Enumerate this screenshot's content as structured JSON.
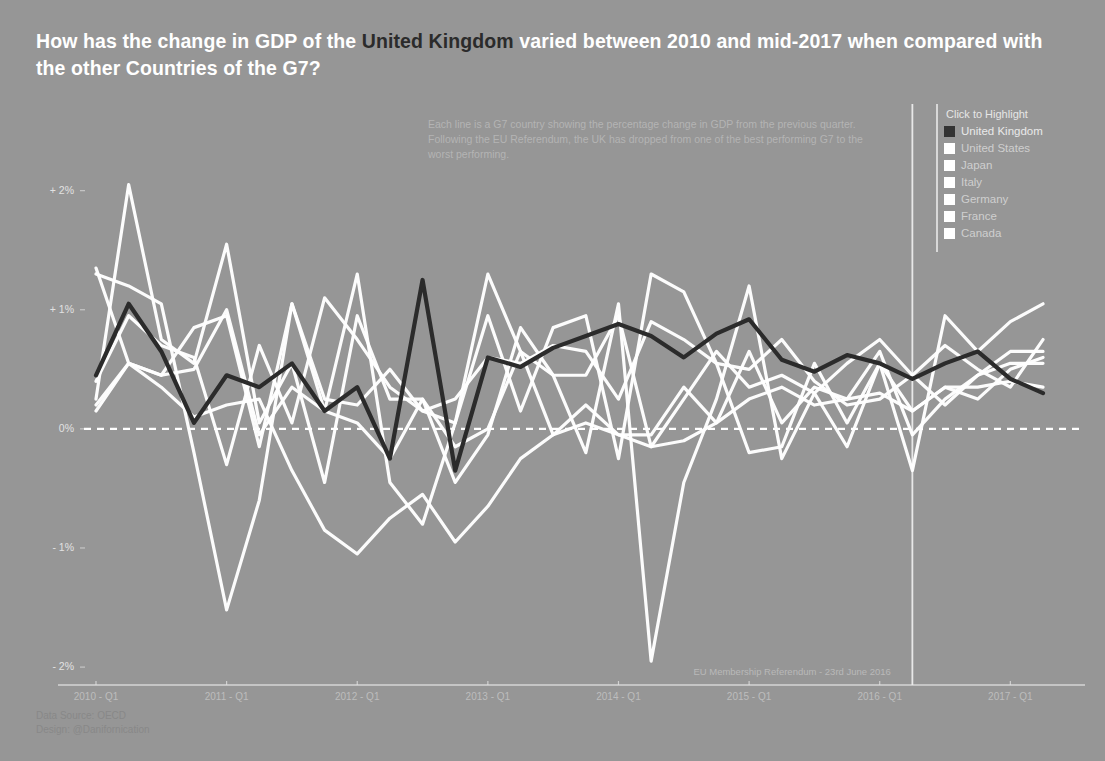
{
  "title": {
    "part1": "How has the change in GDP of the ",
    "highlight": "United Kingdom",
    "part2": " varied between 2010 and mid-2017 when compared with the other Countries of the G7?"
  },
  "annotation": {
    "line1": "Each line is a G7 country showing the percentage change in GDP from the previous quarter.",
    "line2": "Following the EU Referendum, the UK has dropped from one of the best performing G7 to the",
    "line3": "worst performing."
  },
  "legend": {
    "title": "Click to Highlight",
    "items": [
      {
        "label": "United Kingdom",
        "color": "#333333",
        "highlighted": true
      },
      {
        "label": "United States",
        "color": "#ffffff",
        "highlighted": false
      },
      {
        "label": "Japan",
        "color": "#ffffff",
        "highlighted": false
      },
      {
        "label": "Italy",
        "color": "#ffffff",
        "highlighted": false
      },
      {
        "label": "Germany",
        "color": "#ffffff",
        "highlighted": false
      },
      {
        "label": "France",
        "color": "#ffffff",
        "highlighted": false
      },
      {
        "label": "Canada",
        "color": "#ffffff",
        "highlighted": false
      }
    ]
  },
  "referendum": {
    "note": "EU Membership Referendum - 23rd June 2016"
  },
  "footer": {
    "source": "Data Source: OECD",
    "design": "Design: @Danifornication"
  },
  "colors": {
    "background": "#969696",
    "highlight_line": "#2b2b2b",
    "other_line": "#ffffff",
    "zero_line": "#ffffff",
    "axis": "#d8d8d8",
    "title_text": "#ffffff",
    "muted_text": "#bdbdbd"
  },
  "chart_data": {
    "type": "line",
    "title": "How has the change in GDP of the United Kingdom varied between 2010 and mid-2017 when compared with the other Countries of the G7?",
    "subtitle": "Each line is a G7 country showing the percentage change in GDP from the previous quarter. Following the EU Referendum, the UK has dropped from one of the best performing G7 to the worst performing.",
    "xlabel": "",
    "ylabel": "% change in GDP from previous quarter",
    "ylim": [
      -2.1,
      2.4
    ],
    "xlim": [
      "2010-Q1",
      "2017-Q2"
    ],
    "grid": false,
    "legend_position": "top-right",
    "ytick_labels": [
      "+ 2%",
      "+ 1%",
      "0%",
      "- 1%",
      "- 2%"
    ],
    "ytick_values": [
      2,
      1,
      0,
      -1,
      -2
    ],
    "xtick_labels": [
      "2010 - Q1",
      "2011 - Q1",
      "2012 - Q1",
      "2013 - Q1",
      "2014 - Q1",
      "2015 - Q1",
      "2016 - Q1",
      "2017 - Q1"
    ],
    "xtick_values": [
      0,
      4,
      8,
      12,
      16,
      20,
      24,
      28
    ],
    "x": [
      "2010-Q1",
      "2010-Q2",
      "2010-Q3",
      "2010-Q4",
      "2011-Q1",
      "2011-Q2",
      "2011-Q3",
      "2011-Q4",
      "2012-Q1",
      "2012-Q2",
      "2012-Q3",
      "2012-Q4",
      "2013-Q1",
      "2013-Q2",
      "2013-Q3",
      "2013-Q4",
      "2014-Q1",
      "2014-Q2",
      "2014-Q3",
      "2014-Q4",
      "2015-Q1",
      "2015-Q2",
      "2015-Q3",
      "2015-Q4",
      "2016-Q1",
      "2016-Q2",
      "2016-Q3",
      "2016-Q4",
      "2017-Q1",
      "2017-Q2"
    ],
    "annotations": [
      {
        "text": "EU Membership Referendum - 23rd June 2016",
        "x": "2016-Q2",
        "type": "vline"
      }
    ],
    "series": [
      {
        "name": "United Kingdom",
        "color": "#2b2b2b",
        "highlighted": true,
        "values": [
          0.45,
          1.05,
          0.65,
          0.05,
          0.45,
          0.35,
          0.55,
          0.15,
          0.35,
          -0.25,
          1.25,
          -0.35,
          0.6,
          0.52,
          0.68,
          0.78,
          0.88,
          0.78,
          0.6,
          0.8,
          0.92,
          0.58,
          0.48,
          0.62,
          0.55,
          0.42,
          0.55,
          0.65,
          0.42,
          0.3
        ]
      },
      {
        "name": "United States",
        "color": "#ffffff",
        "highlighted": false,
        "values": [
          0.4,
          0.95,
          0.7,
          0.6,
          -0.3,
          0.7,
          0.05,
          1.1,
          0.75,
          0.35,
          0.15,
          0.05,
          0.95,
          0.15,
          0.85,
          0.95,
          -0.25,
          1.3,
          1.15,
          0.55,
          0.5,
          0.75,
          0.4,
          0.2,
          0.25,
          0.45,
          0.7,
          0.5,
          0.35,
          0.75
        ]
      },
      {
        "name": "Japan",
        "color": "#ffffff",
        "highlighted": false,
        "values": [
          1.3,
          1.2,
          1.05,
          -0.2,
          -1.52,
          -0.6,
          1.05,
          0.15,
          1.3,
          -0.45,
          -0.8,
          0.05,
          1.3,
          0.65,
          0.45,
          -0.2,
          1.05,
          -1.95,
          -0.45,
          0.25,
          1.2,
          -0.25,
          0.3,
          -0.15,
          0.55,
          0.15,
          0.35,
          0.25,
          0.5,
          0.6
        ]
      },
      {
        "name": "Italy",
        "color": "#ffffff",
        "highlighted": false,
        "values": [
          0.15,
          0.55,
          0.35,
          0.1,
          0.2,
          0.25,
          -0.35,
          -0.85,
          -1.05,
          -0.75,
          -0.55,
          -0.95,
          -0.65,
          -0.25,
          -0.05,
          0.05,
          -0.05,
          -0.15,
          -0.1,
          0.05,
          0.25,
          0.35,
          0.2,
          0.25,
          0.3,
          0.15,
          0.35,
          0.35,
          0.4,
          0.35
        ]
      },
      {
        "name": "Germany",
        "color": "#ffffff",
        "highlighted": false,
        "values": [
          0.25,
          2.05,
          0.75,
          0.55,
          1.55,
          0.05,
          0.55,
          -0.45,
          0.95,
          0.25,
          0.25,
          -0.45,
          -0.05,
          0.85,
          0.45,
          0.45,
          0.95,
          -0.15,
          0.25,
          0.65,
          0.35,
          0.45,
          0.3,
          0.55,
          0.75,
          0.45,
          0.2,
          0.45,
          0.65,
          0.65
        ]
      },
      {
        "name": "France",
        "color": "#ffffff",
        "highlighted": false,
        "values": [
          0.2,
          0.55,
          0.45,
          0.5,
          1.0,
          -0.05,
          0.35,
          0.15,
          0.05,
          -0.25,
          0.25,
          -0.15,
          0.0,
          0.65,
          -0.05,
          0.2,
          -0.05,
          -0.05,
          0.35,
          0.05,
          0.65,
          0.05,
          0.35,
          0.25,
          0.65,
          -0.05,
          0.25,
          0.45,
          0.55,
          0.55
        ]
      },
      {
        "name": "Canada",
        "color": "#ffffff",
        "highlighted": false,
        "values": [
          1.35,
          0.55,
          0.45,
          0.85,
          0.95,
          -0.15,
          1.05,
          0.25,
          0.2,
          0.5,
          0.15,
          0.25,
          0.6,
          0.55,
          0.7,
          0.65,
          0.25,
          0.9,
          0.75,
          0.55,
          -0.2,
          -0.15,
          0.55,
          0.05,
          0.55,
          -0.35,
          0.95,
          0.65,
          0.9,
          1.05
        ]
      }
    ]
  }
}
